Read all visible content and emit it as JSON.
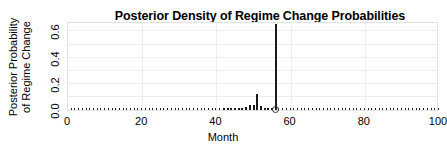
{
  "chart_data": {
    "type": "bar",
    "title": "Posterior Density of Regime Change Probabilities",
    "xlabel": "Month",
    "ylabel": "Posterior Probability\nof Regime Change",
    "xlim": [
      0,
      100
    ],
    "ylim": [
      0.0,
      0.68
    ],
    "xticks": [
      0,
      20,
      40,
      60,
      80,
      100
    ],
    "xtick_labels": [
      "0",
      "20",
      "40",
      "60",
      "80",
      "100"
    ],
    "yticks": [
      0.0,
      0.2,
      0.4,
      0.6
    ],
    "ytick_labels": [
      "0.0",
      "0.2",
      "0.4",
      "0.6"
    ],
    "grid": "horizontal-and-vertical-light",
    "legend": "none",
    "marker_note": "open circle marker at base of tallest spike",
    "marker_x": 56,
    "x": [
      1,
      2,
      3,
      4,
      5,
      6,
      7,
      8,
      9,
      10,
      11,
      12,
      13,
      14,
      15,
      16,
      17,
      18,
      19,
      20,
      21,
      22,
      23,
      24,
      25,
      26,
      27,
      28,
      29,
      30,
      31,
      32,
      33,
      34,
      35,
      36,
      37,
      38,
      39,
      40,
      41,
      42,
      43,
      44,
      45,
      46,
      47,
      48,
      49,
      50,
      51,
      52,
      53,
      54,
      55,
      56,
      57,
      58,
      59,
      60,
      61,
      62,
      63,
      64,
      65,
      66,
      67,
      68,
      69,
      70,
      71,
      72,
      73,
      74,
      75,
      76,
      77,
      78,
      79,
      80,
      81,
      82,
      83,
      84,
      85,
      86,
      87,
      88,
      89,
      90,
      91,
      92,
      93,
      94,
      95,
      96,
      97,
      98,
      99,
      100
    ],
    "values": [
      0.002,
      0.002,
      0.002,
      0.002,
      0.002,
      0.002,
      0.002,
      0.002,
      0.002,
      0.002,
      0.002,
      0.002,
      0.002,
      0.002,
      0.002,
      0.002,
      0.002,
      0.002,
      0.002,
      0.002,
      0.002,
      0.002,
      0.002,
      0.002,
      0.002,
      0.002,
      0.002,
      0.002,
      0.002,
      0.002,
      0.002,
      0.002,
      0.002,
      0.003,
      0.003,
      0.003,
      0.003,
      0.003,
      0.004,
      0.004,
      0.004,
      0.005,
      0.005,
      0.006,
      0.007,
      0.009,
      0.014,
      0.022,
      0.04,
      0.035,
      0.125,
      0.03,
      0.012,
      0.008,
      0.006,
      0.66,
      0.004,
      0.003,
      0.003,
      0.002,
      0.002,
      0.002,
      0.002,
      0.002,
      0.002,
      0.002,
      0.002,
      0.002,
      0.002,
      0.002,
      0.002,
      0.002,
      0.002,
      0.002,
      0.002,
      0.002,
      0.002,
      0.002,
      0.002,
      0.002,
      0.002,
      0.002,
      0.002,
      0.002,
      0.002,
      0.002,
      0.002,
      0.002,
      0.002,
      0.002,
      0.002,
      0.002,
      0.002,
      0.002,
      0.002,
      0.002,
      0.002,
      0.002,
      0.002,
      0.002
    ]
  },
  "colors": {
    "stem": "#1a1a1a",
    "grid": "#ededed",
    "panel_border": "#e2e2e2",
    "text": "#000000"
  }
}
